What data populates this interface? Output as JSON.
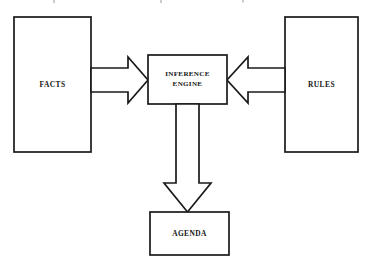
{
  "diagram": {
    "background_color": "#ffffff",
    "line_color": "#1a1a1a",
    "text_color": "#141414",
    "nodes": [
      {
        "id": "facts",
        "label": "FACTS",
        "shape": "rectangle",
        "x": 14,
        "y": 17,
        "width": 77,
        "height": 135
      },
      {
        "id": "inference_engine",
        "label_line1": "INFERENCE",
        "label_line2": "ENGINE",
        "shape": "rectangle",
        "x": 148,
        "y": 55,
        "width": 79,
        "height": 49
      },
      {
        "id": "rules",
        "label": "RULES",
        "shape": "rectangle",
        "x": 285,
        "y": 17,
        "width": 73,
        "height": 135
      },
      {
        "id": "agenda",
        "label": "AGENDA",
        "shape": "rectangle",
        "x": 150,
        "y": 212,
        "width": 79,
        "height": 43
      }
    ],
    "connectors": [
      {
        "id": "facts-to-engine",
        "from": "facts",
        "to": "inference_engine",
        "style": "block-arrow",
        "direction": "right"
      },
      {
        "id": "rules-to-engine",
        "from": "rules",
        "to": "inference_engine",
        "style": "block-arrow",
        "direction": "left"
      },
      {
        "id": "engine-to-agenda",
        "from": "inference_engine",
        "to": "agenda",
        "style": "block-arrow",
        "direction": "down"
      }
    ]
  }
}
